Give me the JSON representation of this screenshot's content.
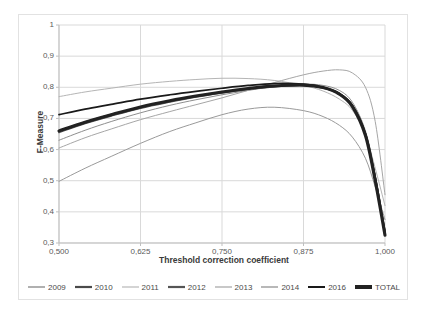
{
  "chart_data": {
    "type": "line",
    "title": "",
    "xlabel": "Threshold correction coefficient",
    "ylabel": "F-Measure",
    "xlim": [
      0.5,
      1.0
    ],
    "ylim": [
      0.3,
      1.0
    ],
    "grid": true,
    "legend_position": "bottom",
    "x_tick_labels": [
      "0,500",
      "0,625",
      "0,750",
      "0,875",
      "1,000"
    ],
    "x_ticks": [
      0.5,
      0.625,
      0.75,
      0.875,
      1.0
    ],
    "y_tick_labels": [
      "0,3",
      "0,4",
      "0,5",
      "0,6",
      "0,7",
      "0,8",
      "0,9",
      "1"
    ],
    "y_ticks": [
      0.3,
      0.4,
      0.5,
      0.6,
      0.7,
      0.8,
      0.9,
      1.0
    ],
    "x": [
      0.5,
      0.54,
      0.58,
      0.625,
      0.67,
      0.71,
      0.75,
      0.79,
      0.83,
      0.875,
      0.905,
      0.93,
      0.95,
      0.97,
      0.985,
      1.0
    ],
    "series": [
      {
        "name": "2009",
        "color": "#8e8e8e",
        "width": 1.0,
        "values": [
          0.63,
          0.662,
          0.69,
          0.718,
          0.742,
          0.76,
          0.776,
          0.79,
          0.802,
          0.81,
          0.806,
          0.79,
          0.752,
          0.66,
          0.52,
          0.34
        ]
      },
      {
        "name": "2010",
        "color": "#4a4a4a",
        "width": 1.7,
        "values": [
          0.66,
          0.688,
          0.712,
          0.736,
          0.756,
          0.771,
          0.784,
          0.795,
          0.803,
          0.806,
          0.798,
          0.778,
          0.74,
          0.65,
          0.51,
          0.335
        ]
      },
      {
        "name": "2011",
        "color": "#b5b5b5",
        "width": 1.0,
        "values": [
          0.77,
          0.785,
          0.797,
          0.81,
          0.819,
          0.825,
          0.829,
          0.828,
          0.822,
          0.806,
          0.788,
          0.762,
          0.726,
          0.648,
          0.54,
          0.42
        ]
      },
      {
        "name": "2012",
        "color": "#555555",
        "width": 1.6,
        "values": [
          0.655,
          0.684,
          0.708,
          0.733,
          0.753,
          0.769,
          0.782,
          0.793,
          0.802,
          0.807,
          0.8,
          0.78,
          0.742,
          0.652,
          0.512,
          0.338
        ]
      },
      {
        "name": "2013",
        "color": "#9a9a9a",
        "width": 1.0,
        "values": [
          0.498,
          0.54,
          0.578,
          0.62,
          0.658,
          0.686,
          0.712,
          0.73,
          0.736,
          0.725,
          0.706,
          0.678,
          0.64,
          0.572,
          0.48,
          0.375
        ]
      },
      {
        "name": "2014",
        "color": "#a6a6a6",
        "width": 1.0,
        "values": [
          0.605,
          0.638,
          0.666,
          0.696,
          0.722,
          0.744,
          0.766,
          0.79,
          0.815,
          0.84,
          0.852,
          0.856,
          0.846,
          0.8,
          0.69,
          0.455
        ]
      },
      {
        "name": "2016",
        "color": "#1a1a1a",
        "width": 1.7,
        "values": [
          0.712,
          0.73,
          0.745,
          0.762,
          0.776,
          0.787,
          0.797,
          0.806,
          0.812,
          0.81,
          0.8,
          0.78,
          0.742,
          0.65,
          0.508,
          0.33
        ]
      },
      {
        "name": "TOTAL",
        "color": "#222222",
        "width": 3.1,
        "values": [
          0.66,
          0.688,
          0.712,
          0.737,
          0.757,
          0.772,
          0.785,
          0.796,
          0.804,
          0.807,
          0.799,
          0.778,
          0.738,
          0.645,
          0.5,
          0.325
        ]
      }
    ]
  },
  "legend": {
    "entries": [
      {
        "label": "2009",
        "color": "#8e8e8e",
        "width": 1.4
      },
      {
        "label": "2010",
        "color": "#4a4a4a",
        "width": 2.2
      },
      {
        "label": "2011",
        "color": "#c2c2c2",
        "width": 1.4
      },
      {
        "label": "2012",
        "color": "#555555",
        "width": 2.2
      },
      {
        "label": "2013",
        "color": "#b0b0b0",
        "width": 1.4
      },
      {
        "label": "2014",
        "color": "#9a9a9a",
        "width": 1.4
      },
      {
        "label": "2016",
        "color": "#1a1a1a",
        "width": 2.0
      },
      {
        "label": "TOTAL",
        "color": "#222222",
        "width": 4.0
      }
    ]
  },
  "style": {
    "grid_color": "#d9d9d9",
    "axis_color": "#bfbfbf",
    "border_color": "#e2e2e2",
    "text_color": "#3a3a3a",
    "tick_text_color": "#5a5a5a",
    "background": "#ffffff"
  }
}
